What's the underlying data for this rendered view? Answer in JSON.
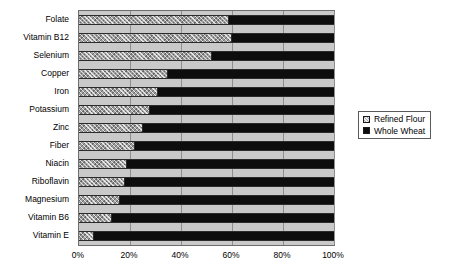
{
  "chart_data": {
    "type": "bar",
    "orientation": "horizontal",
    "stacked": true,
    "normalized_percent": true,
    "title": "",
    "xlabel": "",
    "ylabel": "",
    "xlim": [
      0,
      100
    ],
    "grid": true,
    "legend_position": "right",
    "categories": [
      "Folate",
      "Vitamin B12",
      "Selenium",
      "Copper",
      "Iron",
      "Potassium",
      "Zinc",
      "Fiber",
      "Niacin",
      "Riboflavin",
      "Magnesium",
      "Vitamin B6",
      "Vitamin E"
    ],
    "xticks": [
      "0%",
      "20%",
      "40%",
      "60%",
      "80%",
      "100%"
    ],
    "xtick_values": [
      0,
      20,
      40,
      60,
      80,
      100
    ],
    "series": [
      {
        "name": "Refined Flour",
        "pattern": "hatched",
        "color": "#9e9e9e",
        "values": [
          59,
          60,
          52,
          35,
          31,
          28,
          25,
          22,
          19,
          18,
          16,
          13,
          6
        ]
      },
      {
        "name": "Whole Wheat",
        "pattern": "solid",
        "color": "#0d0d0d",
        "values": [
          41,
          40,
          48,
          65,
          69,
          72,
          75,
          78,
          81,
          82,
          84,
          87,
          94
        ]
      }
    ]
  },
  "legend": {
    "items": [
      {
        "label": "Refined Flour",
        "swatch": "hatched-gray-swatch"
      },
      {
        "label": "Whole Wheat",
        "swatch": "solid-black-swatch"
      }
    ]
  }
}
